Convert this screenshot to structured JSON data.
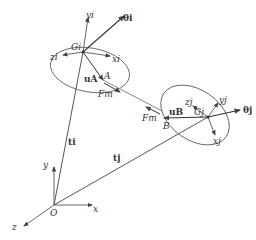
{
  "diagram": {
    "type": "two-body kinematic diagram",
    "colors": {
      "line": "#555555",
      "text": "#333333",
      "background": "#ffffff"
    },
    "global_frame": {
      "origin": "O",
      "x": "x",
      "y": "y",
      "z": "z"
    },
    "body_i": {
      "center": "G_i",
      "center_label": "Gi",
      "axes": {
        "x": "xi",
        "y": "yi",
        "z": "zi"
      },
      "rotation": "θi",
      "position_vector": "ti",
      "attachment_point": "A",
      "local_vector": "uA"
    },
    "body_j": {
      "center": "G_j",
      "center_label": "Gj",
      "axes": {
        "x": "xj",
        "y": "yj",
        "z": "zj"
      },
      "rotation": "θj",
      "position_vector": "tj",
      "attachment_point": "B",
      "local_vector": "uB"
    },
    "force": {
      "label": "Fm",
      "label_2": "Fm"
    }
  }
}
